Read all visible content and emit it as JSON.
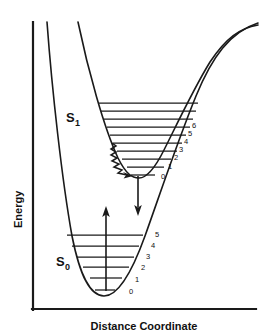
{
  "figure": {
    "background_color": "#ffffff",
    "line_color": "#1a1a1a"
  },
  "axes": {
    "y_label": "Energy",
    "x_label": "Distance Coordinate",
    "origin_x": 32,
    "origin_y": 310,
    "y_top": 22,
    "x_right": 258
  },
  "states": [
    {
      "id": "S1",
      "label_base": "S",
      "label_sub": "1",
      "label_x": 66,
      "label_y": 122,
      "minimum_x": 138,
      "minimum_y": 176,
      "description": "first excited singlet state"
    },
    {
      "id": "S0",
      "label_base": "S",
      "label_sub": "0",
      "label_x": 56,
      "label_y": 266,
      "minimum_x": 104,
      "minimum_y": 295,
      "description": "singlet ground state"
    }
  ],
  "s1_levels": [
    {
      "v": "",
      "y": 103,
      "x1": 99,
      "x2": 198,
      "labeled": false
    },
    {
      "v": "",
      "y": 111,
      "x1": 101,
      "x2": 196,
      "labeled": false
    },
    {
      "v": "",
      "y": 119,
      "x1": 104,
      "x2": 193,
      "labeled": false
    },
    {
      "v": "6",
      "y": 127,
      "x1": 107,
      "x2": 190,
      "labeled": true,
      "label_x": 192,
      "label_y": 125
    },
    {
      "v": "5",
      "y": 135,
      "x1": 110,
      "x2": 186,
      "labeled": true,
      "label_x": 188,
      "label_y": 133
    },
    {
      "v": "4",
      "y": 143,
      "x1": 113,
      "x2": 182,
      "labeled": true,
      "label_x": 184,
      "label_y": 141
    },
    {
      "v": "3",
      "y": 151,
      "x1": 117,
      "x2": 177,
      "labeled": true,
      "label_x": 180,
      "label_y": 149
    },
    {
      "v": "2",
      "y": 159,
      "x1": 122,
      "x2": 171,
      "labeled": true,
      "label_x": 175,
      "label_y": 157
    },
    {
      "v": "1",
      "y": 167,
      "x1": 128,
      "x2": 164,
      "labeled": true,
      "label_x": 169,
      "label_y": 165
    },
    {
      "v": "0",
      "y": 175,
      "x1": 131,
      "x2": 155,
      "labeled": true,
      "label_x": 163,
      "label_y": 175
    }
  ],
  "s0_levels": [
    {
      "v": "5",
      "y": 235,
      "x1": 67,
      "x2": 143,
      "labeled": true,
      "label_x": 156,
      "label_y": 234
    },
    {
      "v": "4",
      "y": 246,
      "x1": 72,
      "x2": 139,
      "labeled": true,
      "label_x": 152,
      "label_y": 246
    },
    {
      "v": "3",
      "y": 257,
      "x1": 77,
      "x2": 134,
      "labeled": true,
      "label_x": 147,
      "label_y": 257
    },
    {
      "v": "2",
      "y": 267,
      "x1": 83,
      "x2": 129,
      "labeled": true,
      "label_x": 142,
      "label_y": 267
    },
    {
      "v": "1",
      "y": 278,
      "x1": 90,
      "x2": 122,
      "labeled": true,
      "label_x": 136,
      "label_y": 279
    },
    {
      "v": "0",
      "y": 290,
      "x1": 95,
      "x2": 115,
      "labeled": true,
      "label_x": 130,
      "label_y": 291
    }
  ],
  "transitions": [
    {
      "id": "absorption",
      "name": "absorption-arrow",
      "direction": "up",
      "x": 106,
      "y_start": 290,
      "y_end": 146
    },
    {
      "id": "emission",
      "name": "emission-arrow",
      "direction": "down",
      "x": 138,
      "y_start": 176,
      "y_end": 214
    },
    {
      "id": "vibrational-relaxation",
      "name": "vibrational-relaxation-squiggle",
      "direction": "down-right",
      "start_x": 112,
      "start_y": 144,
      "end_x": 137,
      "end_y": 174
    }
  ],
  "curves": {
    "s0_left_arm_top": {
      "x": 47,
      "y": 22
    },
    "s0_right_arm_top": {
      "x": 258,
      "y": 45
    },
    "s1_left_arm_top": {
      "x": 78,
      "y": 22
    },
    "s1_right_arm_top": {
      "x": 258,
      "y": 28
    },
    "crossing_point": {
      "x": 212,
      "y": 100
    }
  }
}
